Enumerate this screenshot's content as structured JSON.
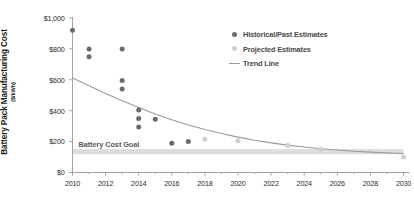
{
  "chart_data": {
    "type": "scatter",
    "title": "",
    "xlabel": "",
    "ylabel": "Battery Pack Manufacturing Cost",
    "ylabel_units": "($/kWh)",
    "xlim": [
      2010,
      2030
    ],
    "ylim": [
      0,
      1000
    ],
    "grid": false,
    "legend_position": "top-right",
    "ytick_labels": [
      "$1,000",
      "$800",
      "$600",
      "$400",
      "$200",
      "$0"
    ],
    "ytick_values": [
      1000,
      800,
      600,
      400,
      200,
      0
    ],
    "xtick_labels": [
      "2010",
      "2012",
      "2014",
      "2016",
      "2018",
      "2020",
      "2022",
      "2024",
      "2026",
      "2028",
      "2030"
    ],
    "xtick_values": [
      2010,
      2012,
      2014,
      2016,
      2018,
      2020,
      2022,
      2024,
      2026,
      2028,
      2030
    ],
    "xtick_minor_values": [
      2011,
      2013,
      2015,
      2017,
      2019,
      2021,
      2023,
      2025,
      2027,
      2029
    ],
    "series": [
      {
        "name": "Historical/Past Estimates",
        "marker": "circle",
        "color": "#6b6b6b",
        "points": [
          {
            "x": 2010,
            "y": 920
          },
          {
            "x": 2011,
            "y": 800
          },
          {
            "x": 2011,
            "y": 750
          },
          {
            "x": 2013,
            "y": 800
          },
          {
            "x": 2013,
            "y": 595
          },
          {
            "x": 2013,
            "y": 540
          },
          {
            "x": 2014,
            "y": 405
          },
          {
            "x": 2014,
            "y": 350
          },
          {
            "x": 2014,
            "y": 295
          },
          {
            "x": 2015,
            "y": 345
          },
          {
            "x": 2016,
            "y": 190
          },
          {
            "x": 2017,
            "y": 200
          }
        ]
      },
      {
        "name": "Projected Estimates",
        "marker": "circle",
        "color": "#cfcfcf",
        "points": [
          {
            "x": 2018,
            "y": 215
          },
          {
            "x": 2020,
            "y": 205
          },
          {
            "x": 2023,
            "y": 175
          },
          {
            "x": 2025,
            "y": 150
          },
          {
            "x": 2030,
            "y": 100
          }
        ]
      }
    ],
    "trend_line": {
      "name": "Trend Line",
      "color": "#9a9a9a",
      "points": [
        {
          "x": 2010,
          "y": 612
        },
        {
          "x": 2011,
          "y": 562
        },
        {
          "x": 2012,
          "y": 512
        },
        {
          "x": 2013,
          "y": 464
        },
        {
          "x": 2014,
          "y": 420
        },
        {
          "x": 2015,
          "y": 379
        },
        {
          "x": 2016,
          "y": 341
        },
        {
          "x": 2017,
          "y": 308
        },
        {
          "x": 2018,
          "y": 278
        },
        {
          "x": 2019,
          "y": 252
        },
        {
          "x": 2020,
          "y": 229
        },
        {
          "x": 2021,
          "y": 209
        },
        {
          "x": 2022,
          "y": 192
        },
        {
          "x": 2023,
          "y": 177
        },
        {
          "x": 2024,
          "y": 165
        },
        {
          "x": 2025,
          "y": 154
        },
        {
          "x": 2026,
          "y": 146
        },
        {
          "x": 2027,
          "y": 138
        },
        {
          "x": 2028,
          "y": 132
        },
        {
          "x": 2029,
          "y": 127
        },
        {
          "x": 2030,
          "y": 123
        }
      ]
    },
    "goal_band": {
      "label": "Battery Cost Goal",
      "y_low": 118,
      "y_high": 152,
      "color": "#dedede",
      "x_start": 2010,
      "x_end": 2030
    },
    "legend": [
      {
        "label": "Historical/Past Estimates",
        "type": "dot",
        "color": "#6b6b6b"
      },
      {
        "label": "Projected Estimates",
        "type": "dot",
        "color": "#cfcfcf"
      },
      {
        "label": "Trend Line",
        "type": "line",
        "color": "#9a9a9a"
      }
    ],
    "axis_color": "#9a9a9a"
  }
}
